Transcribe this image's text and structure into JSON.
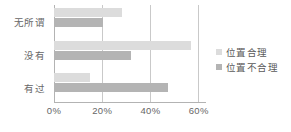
{
  "chart_data": {
    "type": "bar",
    "orientation": "horizontal",
    "title": "",
    "xlabel": "",
    "ylabel": "",
    "categories": [
      "无所谓",
      "没有",
      "有过"
    ],
    "series": [
      {
        "name": "位置合理",
        "color": "#dcdcdc",
        "values": [
          28.5,
          57.0,
          15.0
        ]
      },
      {
        "name": "位置不合理",
        "color": "#b4b4b4",
        "values": [
          20.5,
          32.0,
          47.5
        ]
      }
    ],
    "xlim": [
      0,
      63
    ],
    "xticks": [
      0,
      20,
      40,
      60
    ],
    "xtick_labels": [
      "0%",
      "20%",
      "40%",
      "60%"
    ],
    "grid": true,
    "legend_position": "right"
  },
  "legend": {
    "items": [
      {
        "label": "位置合理"
      },
      {
        "label": "位置不合理"
      }
    ]
  },
  "colors": {
    "series_light": "#dcdcdc",
    "series_dark": "#b4b4b4",
    "gridline": "#c9c9c9",
    "axis": "#b3b3b3",
    "text": "#666666",
    "background": "#ffffff"
  }
}
